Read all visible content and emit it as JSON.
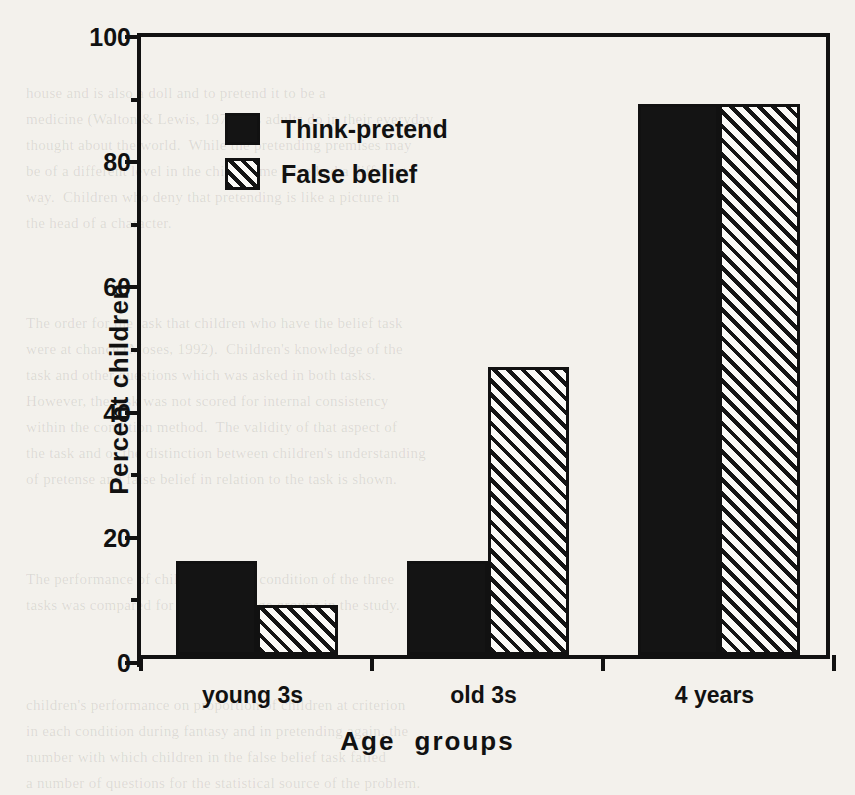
{
  "chart_data": {
    "type": "bar",
    "title": "",
    "xlabel": "Age  groups",
    "ylabel": "Percent children",
    "categories": [
      "young 3s",
      "old 3s",
      "4 years"
    ],
    "series": [
      {
        "name": "Think-pretend",
        "values": [
          15,
          15,
          88
        ],
        "fill": "solid",
        "color": "#141414"
      },
      {
        "name": "False belief",
        "values": [
          8,
          46,
          88
        ],
        "fill": "hatch",
        "color": "#141414"
      }
    ],
    "ylim": [
      0,
      100
    ],
    "yticks": [
      0,
      20,
      40,
      60,
      80,
      100
    ],
    "yticklabels": [
      "0",
      "20",
      "40",
      "60",
      "80",
      "100"
    ],
    "yminorticks": [
      10,
      30,
      50,
      70,
      90
    ],
    "grid": false,
    "legend_position": "upper-left-inside"
  },
  "legend": {
    "entries": [
      {
        "label": "Think-pretend",
        "swatch": "solid-square-icon"
      },
      {
        "label": "False belief",
        "swatch": "hatched-square-icon"
      }
    ]
  },
  "background_text": {
    "block1": "house and is also a doll and to pretend it to be a\nmedicine (Walton & Lewis, 1977), as adults do in their everyday\nthought about the world.  While the pretending premises may\nbe of a different level in the child, some have had a different\nway.  Children who deny that pretending is like a picture in\nthe head of a character.",
    "block2": "The order for the task that children who have the belief task\nwere at chance (Moses, 1992).  Children's knowledge of the\ntask and other questions which was asked in both tasks.\nHowever, the task was not scored for internal consistency\nwithin the condition method.  The validity of that aspect of\nthe task and of the distinction between children's understanding\nof pretense and false belief in relation to the task is shown.",
    "block3": "The performance of children in each condition of the three\ntasks was compared for each of the age groups in the study.",
    "block4": "children's performance on proportion of children at criterion\nin each condition during fantasy and in pretending again, the\nnumber with which children in the false belief task failed\na number of questions for the statistical source of the problem."
  }
}
